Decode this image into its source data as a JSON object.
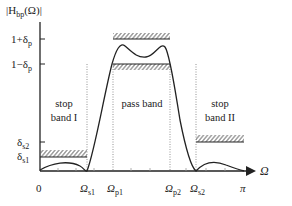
{
  "diagram": {
    "y_axis_label": {
      "main": "|H",
      "sub": "bp",
      "rest": "(Ω)|"
    },
    "x_axis_label": "Ω",
    "y_ticks": [
      {
        "id": "one_plus_dp",
        "main": "1+δ",
        "sub": "p"
      },
      {
        "id": "one_minus_dp",
        "main": "1−δ",
        "sub": "p"
      },
      {
        "id": "ds2",
        "main": "δ",
        "sub": "s2"
      },
      {
        "id": "ds1",
        "main": "δ",
        "sub": "s1"
      }
    ],
    "x_ticks": [
      {
        "id": "zero",
        "main": "0",
        "sub": ""
      },
      {
        "id": "ws1",
        "main": "Ω",
        "sub": "s1"
      },
      {
        "id": "wp1",
        "main": "Ω",
        "sub": "p1"
      },
      {
        "id": "wp2",
        "main": "Ω",
        "sub": "p2"
      },
      {
        "id": "ws2",
        "main": "Ω",
        "sub": "s2"
      },
      {
        "id": "pi",
        "main": "π",
        "sub": ""
      }
    ],
    "regions": {
      "stop1": {
        "line1": "stop",
        "line2": "band I"
      },
      "pass": {
        "line1": "pass band"
      },
      "stop2": {
        "line1": "stop",
        "line2": "band II"
      }
    },
    "colors": {
      "stroke": "#222222",
      "hatch": "#555555",
      "dotted": "#777777"
    }
  }
}
